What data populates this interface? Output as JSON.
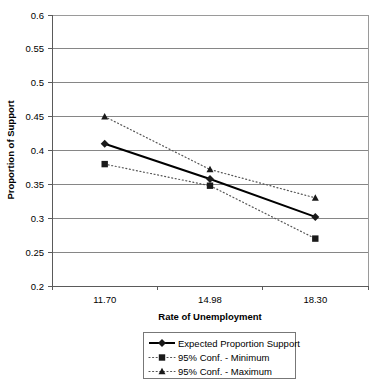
{
  "chart_data": {
    "type": "line",
    "title": "",
    "xlabel": "Rate of Unemployment",
    "ylabel": "Proportion of Support",
    "categories": [
      "11.70",
      "14.98",
      "18.30"
    ],
    "x": [
      11.7,
      14.98,
      18.3
    ],
    "ylim": [
      0.2,
      0.6
    ],
    "yticks": [
      "0.2",
      "0.25",
      "0.3",
      "0.35",
      "0.4",
      "0.45",
      "0.5",
      "0.55",
      "0.6"
    ],
    "ytick_values": [
      0.2,
      0.25,
      0.3,
      0.35,
      0.4,
      0.45,
      0.5,
      0.55,
      0.6
    ],
    "grid": true,
    "legend_position": "bottom",
    "series": [
      {
        "name": "Expected Proportion Support",
        "values": [
          0.41,
          0.358,
          0.302
        ],
        "marker": "diamond",
        "line": "solid",
        "color": "#000000"
      },
      {
        "name": "95% Conf. - Minimum",
        "values": [
          0.38,
          0.348,
          0.27
        ],
        "marker": "square",
        "line": "dotted",
        "color": "#555555"
      },
      {
        "name": "95% Conf. - Maximum",
        "values": [
          0.45,
          0.372,
          0.33
        ],
        "marker": "triangle",
        "line": "dotted",
        "color": "#555555"
      }
    ]
  },
  "axes": {
    "y_title": "Proportion of Support",
    "x_title": "Rate of Unemployment",
    "y_tick_0": "0.2",
    "y_tick_1": "0.25",
    "y_tick_2": "0.3",
    "y_tick_3": "0.35",
    "y_tick_4": "0.4",
    "y_tick_5": "0.45",
    "y_tick_6": "0.5",
    "y_tick_7": "0.55",
    "y_tick_8": "0.6",
    "x_tick_0": "11.70",
    "x_tick_1": "14.98",
    "x_tick_2": "18.30"
  },
  "legend": {
    "items": [
      {
        "label": "Expected Proportion Support"
      },
      {
        "label": "95% Conf. - Minimum"
      },
      {
        "label": "95% Conf. - Maximum"
      }
    ]
  }
}
